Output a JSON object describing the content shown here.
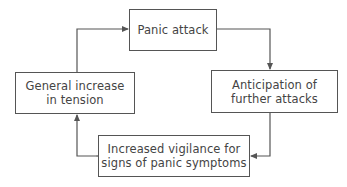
{
  "diagram": {
    "type": "cycle-flowchart",
    "colors": {
      "line": "#555555",
      "text": "#444444",
      "background": "#ffffff"
    },
    "nodes": [
      {
        "id": "panic",
        "lines": [
          "Panic attack"
        ]
      },
      {
        "id": "anticipation",
        "lines": [
          "Anticipation of",
          "further attacks"
        ]
      },
      {
        "id": "vigilance",
        "lines": [
          "Increased vigilance for",
          "signs of panic symptoms"
        ]
      },
      {
        "id": "tension",
        "lines": [
          "General increase",
          "in tension"
        ]
      }
    ],
    "edges": [
      {
        "from": "panic",
        "to": "anticipation"
      },
      {
        "from": "anticipation",
        "to": "vigilance"
      },
      {
        "from": "vigilance",
        "to": "tension"
      },
      {
        "from": "tension",
        "to": "panic"
      }
    ]
  }
}
